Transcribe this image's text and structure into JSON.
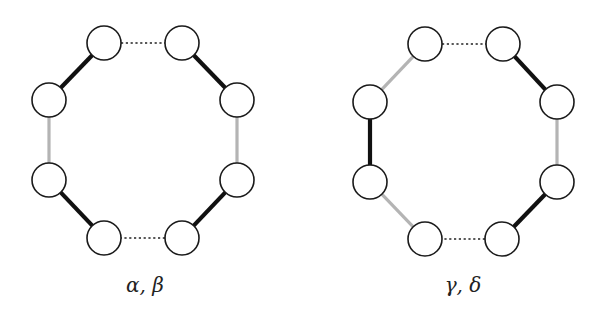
{
  "figure": {
    "panels": [
      {
        "id": "left",
        "label": "α, β",
        "label_pos": [
          145,
          292
        ],
        "nodes": [
          {
            "id": "n1",
            "x": 104,
            "y": 43
          },
          {
            "id": "n2",
            "x": 182,
            "y": 43
          },
          {
            "id": "n3",
            "x": 237,
            "y": 100
          },
          {
            "id": "n4",
            "x": 237,
            "y": 180
          },
          {
            "id": "n5",
            "x": 182,
            "y": 238
          },
          {
            "id": "n6",
            "x": 104,
            "y": 238
          },
          {
            "id": "n7",
            "x": 49,
            "y": 180
          },
          {
            "id": "n8",
            "x": 49,
            "y": 100
          }
        ],
        "edges": [
          {
            "from": "n1",
            "to": "n2",
            "style": "dotted"
          },
          {
            "from": "n2",
            "to": "n3",
            "style": "black"
          },
          {
            "from": "n3",
            "to": "n4",
            "style": "gray"
          },
          {
            "from": "n4",
            "to": "n5",
            "style": "black"
          },
          {
            "from": "n5",
            "to": "n6",
            "style": "dotted"
          },
          {
            "from": "n6",
            "to": "n7",
            "style": "black"
          },
          {
            "from": "n7",
            "to": "n8",
            "style": "gray"
          },
          {
            "from": "n8",
            "to": "n1",
            "style": "black"
          }
        ]
      },
      {
        "id": "right",
        "label": "γ, δ",
        "label_pos": [
          463,
          292
        ],
        "nodes": [
          {
            "id": "n1",
            "x": 425,
            "y": 44
          },
          {
            "id": "n2",
            "x": 503,
            "y": 44
          },
          {
            "id": "n3",
            "x": 557,
            "y": 102
          },
          {
            "id": "n4",
            "x": 557,
            "y": 182
          },
          {
            "id": "n5",
            "x": 502,
            "y": 239
          },
          {
            "id": "n6",
            "x": 425,
            "y": 239
          },
          {
            "id": "n7",
            "x": 370,
            "y": 182
          },
          {
            "id": "n8",
            "x": 370,
            "y": 102
          }
        ],
        "edges": [
          {
            "from": "n1",
            "to": "n2",
            "style": "dotted"
          },
          {
            "from": "n2",
            "to": "n3",
            "style": "black"
          },
          {
            "from": "n3",
            "to": "n4",
            "style": "gray"
          },
          {
            "from": "n4",
            "to": "n5",
            "style": "black"
          },
          {
            "from": "n5",
            "to": "n6",
            "style": "dotted"
          },
          {
            "from": "n6",
            "to": "n7",
            "style": "gray"
          },
          {
            "from": "n7",
            "to": "n8",
            "style": "black"
          },
          {
            "from": "n8",
            "to": "n1",
            "style": "gray"
          }
        ]
      }
    ],
    "node_radius": 17,
    "colors": {
      "black_edge": "#111111",
      "gray_edge": "#b4b4b4",
      "node_stroke": "#1a1a1a",
      "node_fill": "#ffffff"
    }
  }
}
